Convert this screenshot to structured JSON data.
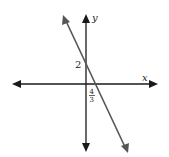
{
  "graph": {
    "axes": {
      "x_label": "x",
      "y_label": "y"
    },
    "line": {
      "y_intercept_label": "2",
      "x_intercept_numerator": "4",
      "x_intercept_denominator": "3",
      "y_intercept": 2,
      "x_intercept": 1.3333,
      "slope": -1.5
    },
    "colors": {
      "axes": "#1a1a1a",
      "line": "#555555"
    }
  }
}
